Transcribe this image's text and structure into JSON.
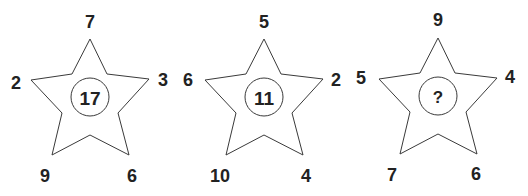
{
  "puzzle": {
    "stars": [
      {
        "center": "17",
        "top": "7",
        "left": "2",
        "right": "3",
        "bottom_left": "9",
        "bottom_right": "6"
      },
      {
        "center": "11",
        "top": "5",
        "left": "6",
        "right": "2",
        "bottom_left": "10",
        "bottom_right": "4"
      },
      {
        "center": "?",
        "top": "9",
        "left": "5",
        "right": "4",
        "bottom_left": "7",
        "bottom_right": "6"
      }
    ]
  },
  "colors": {
    "stroke": "#3a3a3a",
    "text": "#222222",
    "background": "#ffffff"
  }
}
